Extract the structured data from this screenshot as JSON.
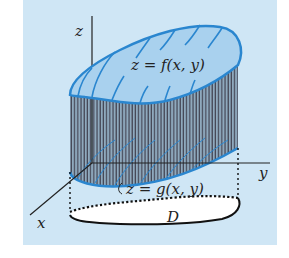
{
  "figure": {
    "colors": {
      "panel_background": "#cfe6f5",
      "surface_fill": "#a9d1ee",
      "surface_edge": "#2a86cf",
      "side_hatch": "#3a3a4a",
      "side_fill": "#8aa9c0",
      "axis": "#222222",
      "domain_fill": "#ffffff",
      "domain_edge": "#111111"
    },
    "axes": {
      "z_label": "z",
      "y_label": "y",
      "x_label": "x"
    },
    "labels": {
      "top_surface": "z = f(x, y)",
      "bottom_surface": "z = g(x, y)",
      "domain": "D"
    }
  }
}
